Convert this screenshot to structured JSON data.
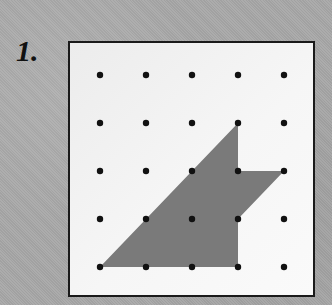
{
  "problem": {
    "number_label": "1."
  },
  "dot_grid": {
    "columns": 5,
    "rows": 5,
    "origin_px": [
      30,
      32
    ],
    "spacing_px": [
      46,
      48
    ],
    "dot_color": "#111111",
    "dot_radius": 3.2
  },
  "shape": {
    "description": "Shaded polygon drawn on dot grid",
    "fill_color": "#7a7a7a",
    "vertices_grid": [
      [
        0,
        4
      ],
      [
        3,
        1
      ],
      [
        3,
        2
      ],
      [
        4,
        2
      ],
      [
        3,
        3
      ],
      [
        3,
        4
      ]
    ]
  },
  "colors": {
    "page_background": "#a8a8a8",
    "box_background": "#f2f2f2",
    "box_border": "#1a1a1a"
  }
}
